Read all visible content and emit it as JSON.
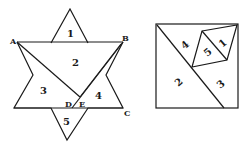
{
  "figure": {
    "star": {
      "point_labels": {
        "A": "A",
        "B": "B",
        "C": "C",
        "D": "D",
        "E": "E"
      },
      "piece_labels": [
        "1",
        "2",
        "3",
        "4",
        "5"
      ]
    },
    "square": {
      "piece_labels": [
        "1",
        "2",
        "3",
        "4",
        "5"
      ]
    }
  }
}
